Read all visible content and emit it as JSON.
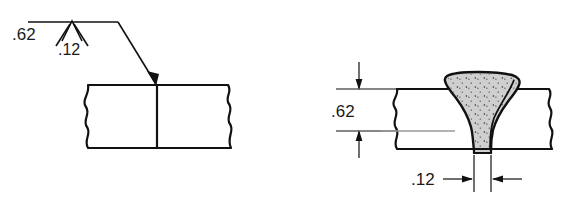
{
  "figure": {
    "colors": {
      "ink": "#111111",
      "weld_fill": "#cfcfcf",
      "centerline": "#9a9a9a",
      "background": "#ffffff"
    }
  },
  "symbol_view": {
    "name": "welding-symbol-view",
    "size_above_label": ".62",
    "groove_depth_label": ".12",
    "reference_line": "horizontal-reference-line",
    "weld_symbol": "v-groove-symbol",
    "leader": "leader-line-with-arrowhead",
    "joint": {
      "left_plate": "plate-left",
      "right_plate": "plate-right",
      "joint_line": "square-butt-joint-line",
      "break_marks": "wavy-break-lines"
    }
  },
  "section_view": {
    "name": "weld-cross-section-view",
    "height_dimension_label": ".62",
    "width_dimension_label": ".12",
    "weld_bead": "weld-bead-stippled",
    "plate": "base-metal-plate",
    "centerline": "plate-centerline",
    "break_marks": "wavy-break-lines",
    "dimension_height": "vertical-dimension-62",
    "dimension_width": "horizontal-dimension-12"
  }
}
